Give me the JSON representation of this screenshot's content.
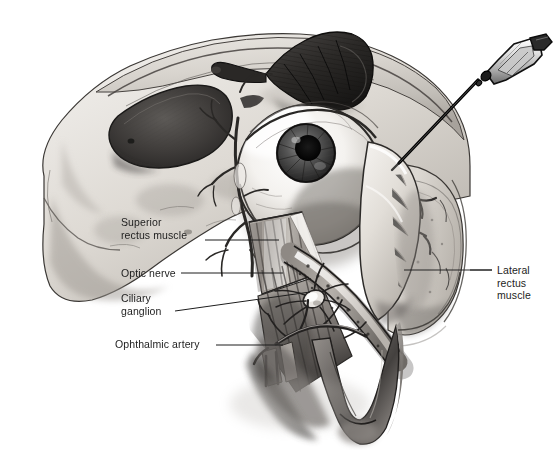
{
  "figure": {
    "background_color": "#ffffff",
    "ink_color": "#1d1d1d",
    "width": 560,
    "height": 463
  },
  "labels": {
    "superior_rectus": "Superior\nrectus muscle",
    "optic_nerve": "Optic nerve",
    "ciliary_ganglion": "Ciliary\nganglion",
    "ophthalmic_artery": "Ophthalmic artery",
    "lateral_rectus": "Lateral\nrectus\nmuscle"
  },
  "structures": {
    "eye_globe": "eye-globe",
    "iris": "iris",
    "pupil": "pupil",
    "syringe_needle": "syringe-needle",
    "needle_hub": "needle-hub",
    "skull_bone": "orbital-bone",
    "sinus_cavity": "sinus-cavity",
    "superior_oblique_tendon": "superior-oblique-tendon",
    "cut_muscle_cross_section": "cut-muscle-cross-section",
    "zygomatic_arch": "zygomatic-arch",
    "vessels": "orbital-vessels"
  },
  "leader_lines": {
    "superior_rectus": "straight-horizontal",
    "optic_nerve": "straight-horizontal",
    "ciliary_ganglion": "angled-up-right",
    "ophthalmic_artery": "straight-horizontal",
    "lateral_rectus": "straight-horizontal-left"
  }
}
